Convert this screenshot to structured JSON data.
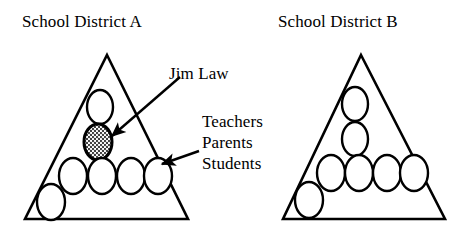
{
  "figure": {
    "width": 463,
    "height": 235,
    "background_color": "#ffffff",
    "stroke_color": "#000000",
    "shaded_fill_color": "#9a9a9a"
  },
  "titles": {
    "district_a": "School District A",
    "district_b": "School District B"
  },
  "callouts": {
    "jim_law": "Jim Law",
    "teachers": "Teachers",
    "parents": "Parents",
    "students": "Students"
  },
  "icons": {
    "arrow_to_jim_law": "arrow-icon",
    "arrow_to_groups": "arrow-icon"
  },
  "diagram": {
    "triangles": [
      {
        "name": "school-district-a",
        "apex": [
          107,
          55
        ],
        "base_left": [
          25,
          219
        ],
        "base_right": [
          188,
          219
        ]
      },
      {
        "name": "school-district-b",
        "apex": [
          361,
          55
        ],
        "base_left": [
          283,
          219
        ],
        "base_right": [
          445,
          219
        ]
      }
    ],
    "nodes_district_a": [
      {
        "name": "teacher-node",
        "cx": 100,
        "cy": 107,
        "rx": 13,
        "ry": 17,
        "shaded": false,
        "inside": true
      },
      {
        "name": "jim-law-node",
        "cx": 98,
        "cy": 142,
        "rx": 14,
        "ry": 18,
        "shaded": true,
        "inside": true
      },
      {
        "name": "student-node",
        "cx": 73,
        "cy": 176,
        "rx": 14,
        "ry": 18,
        "shaded": false,
        "inside": true
      },
      {
        "name": "student-node",
        "cx": 102,
        "cy": 176,
        "rx": 14,
        "ry": 18,
        "shaded": false,
        "inside": true
      },
      {
        "name": "student-node",
        "cx": 131,
        "cy": 176,
        "rx": 14,
        "ry": 18,
        "shaded": false,
        "inside": true
      },
      {
        "name": "student-node",
        "cx": 158,
        "cy": 176,
        "rx": 14,
        "ry": 18,
        "shaded": false,
        "inside": true
      },
      {
        "name": "outside-node",
        "cx": 51,
        "cy": 202,
        "rx": 14,
        "ry": 18,
        "shaded": false,
        "inside": false
      }
    ],
    "nodes_district_b": [
      {
        "name": "teacher-node",
        "cx": 355,
        "cy": 104,
        "rx": 13,
        "ry": 17,
        "shaded": false,
        "inside": true
      },
      {
        "name": "parent-node",
        "cx": 355,
        "cy": 139,
        "rx": 13,
        "ry": 17,
        "shaded": false,
        "inside": true
      },
      {
        "name": "student-node",
        "cx": 331,
        "cy": 173,
        "rx": 14,
        "ry": 18,
        "shaded": false,
        "inside": true
      },
      {
        "name": "student-node",
        "cx": 359,
        "cy": 173,
        "rx": 14,
        "ry": 18,
        "shaded": false,
        "inside": true
      },
      {
        "name": "student-node",
        "cx": 387,
        "cy": 173,
        "rx": 14,
        "ry": 18,
        "shaded": false,
        "inside": true
      },
      {
        "name": "student-node",
        "cx": 414,
        "cy": 173,
        "rx": 14,
        "ry": 18,
        "shaded": false,
        "inside": true
      },
      {
        "name": "outside-node",
        "cx": 309,
        "cy": 200,
        "rx": 14,
        "ry": 18,
        "shaded": false,
        "inside": false
      }
    ],
    "arrows": [
      {
        "name": "arrow-to-jim-law",
        "from": [
          180,
          77
        ],
        "to": [
          112,
          136
        ]
      },
      {
        "name": "arrow-to-groups",
        "from": [
          199,
          151
        ],
        "to": [
          162,
          164
        ]
      }
    ]
  }
}
